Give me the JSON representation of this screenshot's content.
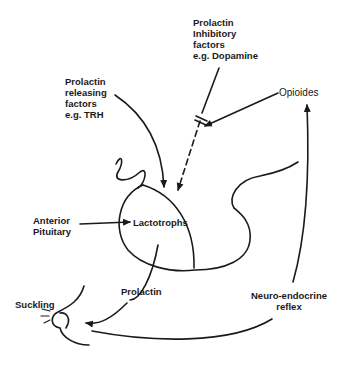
{
  "diagram": {
    "labels": {
      "pif": [
        "Prolactin",
        "Inhibitory",
        "factors",
        "e.g. Dopamine"
      ],
      "prf": [
        "Prolactin",
        "releasing",
        "factors",
        "e.g. TRH"
      ],
      "opioides": "Opioides",
      "anterior_pituitary": [
        "Anterior",
        "Pituitary"
      ],
      "lactotrophs": "Lactotrophs",
      "prolactin": "Prolactin",
      "suckling": "Suckling",
      "neuro_endocrine": [
        "Neuro-endocrine",
        "reflex"
      ]
    },
    "colors": {
      "stroke": "#1a1a1a",
      "background": "#ffffff"
    }
  }
}
